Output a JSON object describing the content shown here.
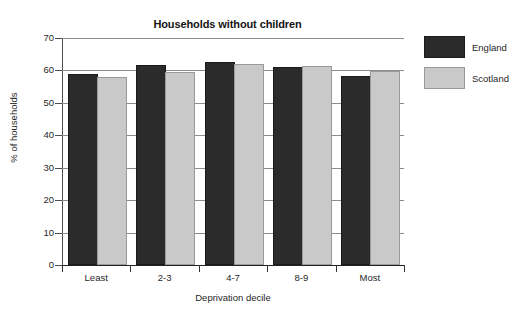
{
  "chart_data": {
    "type": "bar",
    "title": "Households without children",
    "xlabel": "Deprivation decile",
    "ylabel": "% of households",
    "categories": [
      "Least",
      "2-3",
      "4-7",
      "8-9",
      "Most"
    ],
    "series": [
      {
        "name": "England",
        "color": "#2b2b2b",
        "values": [
          58.4,
          61.0,
          62.0,
          60.3,
          57.6
        ]
      },
      {
        "name": "Scotland",
        "color": "#c9c9c9",
        "values": [
          57.4,
          59.0,
          61.5,
          60.7,
          59.3
        ]
      }
    ],
    "ylim": [
      0,
      70
    ],
    "yticks": [
      0,
      10,
      20,
      30,
      40,
      50,
      60,
      70
    ],
    "ytick_labels": [
      "0",
      "10",
      "20",
      "30",
      "40",
      "50",
      "60",
      "70"
    ],
    "grid": true,
    "legend_position": "right"
  }
}
